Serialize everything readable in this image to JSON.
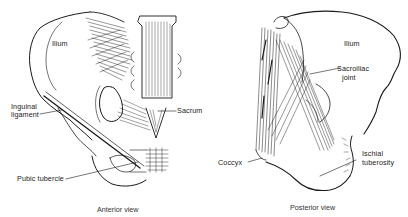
{
  "figure": {
    "panels": [
      {
        "id": "anterior",
        "caption": "Anterior view",
        "labels": {
          "ilium": "Ilium",
          "inguinal_line1": "Inguinal",
          "inguinal_line2": "ligament",
          "sacrum": "Sacrum",
          "pubic_tubercle": "Pubic tubercle"
        }
      },
      {
        "id": "posterior",
        "caption": "Posterior view",
        "labels": {
          "ilium": "Ilium",
          "sacroiliac_line1": "Sacroiliac",
          "sacroiliac_line2": "joint",
          "coccyx": "Coccyx",
          "ischial_line1": "Ischial",
          "ischial_line2": "tuberosity"
        }
      }
    ],
    "colors": {
      "background": "#ffffff",
      "ink": "#1a1a1a",
      "text": "#222222"
    }
  }
}
